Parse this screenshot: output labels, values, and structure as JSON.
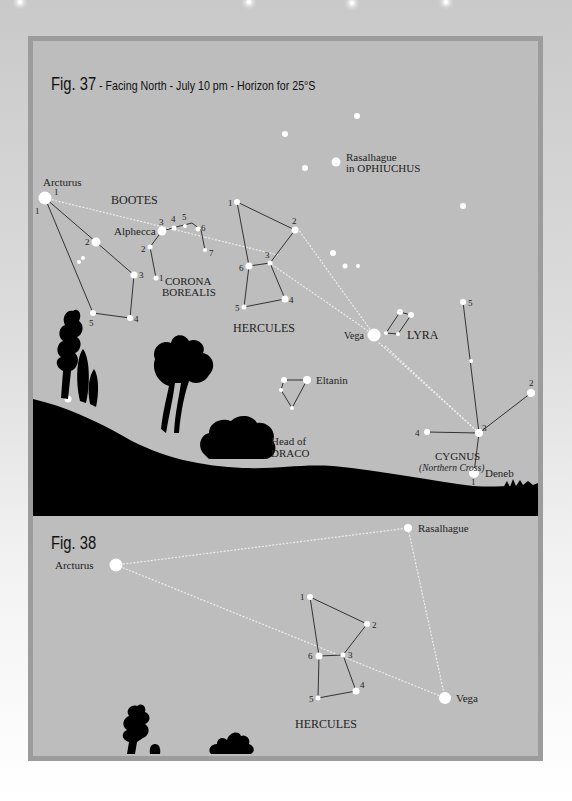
{
  "background_stars": [
    {
      "x": 20,
      "y": 1
    },
    {
      "x": 249,
      "y": 1
    },
    {
      "x": 352,
      "y": 2
    },
    {
      "x": 446,
      "y": 1
    }
  ],
  "fig37": {
    "title_number": "Fig. 37",
    "title_subtitle": " - Facing North - July 10 pm - Horizon for 25°S",
    "labels": {
      "arcturus": "Arcturus",
      "bootes": "BOOTES",
      "alphecca": "Alphecca",
      "corona_1": "CORONA",
      "corona_2": "BOREALIS",
      "hercules": "HERCULES",
      "rasalhague_1": "Rasalhague",
      "rasalhague_2": "in OPHIUCHUS",
      "vega": "Vega",
      "lyra": "LYRA",
      "eltanin": "Eltanin",
      "draco_1": "Head of",
      "draco_2": "DRACO",
      "cygnus": "CYGNUS",
      "cygnus_sub": "(Northern Cross)",
      "deneb": "Deneb"
    },
    "star_numbers": {
      "bootes": [
        "1",
        "1",
        "2",
        "3",
        "4",
        "5"
      ],
      "corona": [
        "1",
        "2",
        "3",
        "4",
        "5",
        "6",
        "7"
      ],
      "hercules": [
        "1",
        "2",
        "3",
        "4",
        "5",
        "6"
      ],
      "cygnus": [
        "1",
        "2",
        "3",
        "4",
        "5"
      ]
    }
  },
  "fig38": {
    "title_number": "Fig. 38",
    "labels": {
      "arcturus": "Arcturus",
      "rasalhague": "Rasalhague",
      "vega": "Vega",
      "hercules": "HERCULES"
    },
    "star_numbers": [
      "1",
      "2",
      "3",
      "4",
      "5",
      "6"
    ]
  },
  "colors": {
    "panel": "#bdbdbd",
    "frame": "#9c9c9c",
    "star": "#ffffff",
    "line": "#333333",
    "pointer_line": "#e8e8e8",
    "silhouette": "#000000"
  }
}
